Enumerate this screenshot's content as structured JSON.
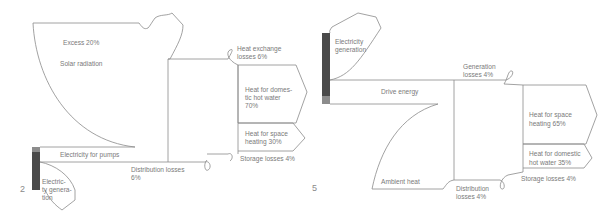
{
  "diagrams": [
    {
      "number": "2",
      "title": "Solar thermal system with electric pumps",
      "nodes": {
        "solar_radiation": "Solar radiation",
        "excess": "Excess 20%",
        "electricity_for_pumps": "Electricity for pumps",
        "electricity_generation": [
          "Electric-",
          "ty genera-",
          "tion"
        ],
        "distribution_losses": [
          "Distribution losses",
          "6%"
        ],
        "heat_exchange_losses": [
          "Heat exchange",
          "losses 6%"
        ],
        "hot_water": [
          "Heat for domes-",
          "tic hot water",
          "70%"
        ],
        "space_heating": [
          "Heat for space",
          "heating  30%"
        ],
        "storage_losses": "Storage losses 4%"
      }
    },
    {
      "number": "5",
      "title": "Heat pump system",
      "nodes": {
        "electricity_generation": [
          "Electricity",
          "generation"
        ],
        "drive_energy": "Drive energy",
        "ambient_heat": "Ambient heat",
        "generation_losses": [
          "Generation",
          "losses 4%"
        ],
        "distribution_losses": [
          "Distribution",
          "losses 4%"
        ],
        "space_heating": [
          "Heat for space",
          "heating 65%"
        ],
        "hot_water": [
          "Heat for domestic",
          "hot water 35%"
        ],
        "storage_losses": "Storage losses 4%"
      }
    }
  ],
  "colors": {
    "line": "#8a8a8a",
    "bar_dark": "#4a4a4a",
    "bar_light": "#8c8c8c",
    "text": "#7a7a7a"
  }
}
